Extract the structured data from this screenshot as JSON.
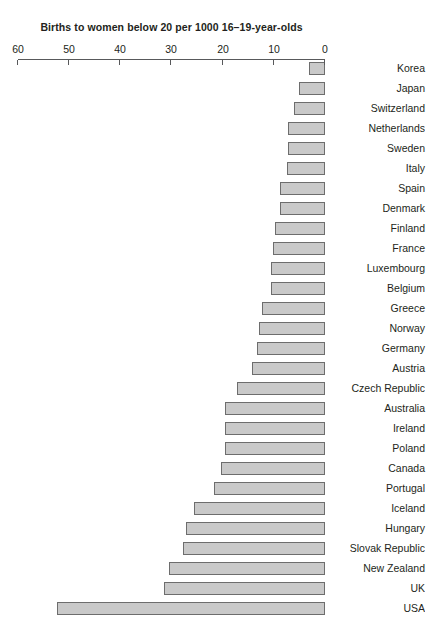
{
  "chart_data": {
    "type": "bar",
    "orientation": "horizontal",
    "title": "",
    "subtitle": "",
    "xlabel": "Births to women below 20 per 1000 16–19-year-olds",
    "ylabel": "",
    "xlim": [
      0,
      60
    ],
    "xticks": [
      0,
      10,
      20,
      30,
      40,
      50,
      60
    ],
    "xtick_labels": [
      "0",
      "10",
      "20",
      "30",
      "40",
      "50",
      "60"
    ],
    "grid": false,
    "legend": null,
    "bar_color": "#c9c9c9",
    "bar_edge_color": "#6d6d6d",
    "axis_color": "#58595b",
    "categories": [
      "USA",
      "UK",
      "New Zealand",
      "Slovak Republic",
      "Hungary",
      "Iceland",
      "Portugal",
      "Canada",
      "Poland",
      "Ireland",
      "Australia",
      "Czech Republic",
      "Austria",
      "Germany",
      "Norway",
      "Greece",
      "Belgium",
      "Luxembourg",
      "France",
      "Finland",
      "Denmark",
      "Spain",
      "Italy",
      "Sweden",
      "Netherlands",
      "Switzerland",
      "Japan",
      "Korea"
    ],
    "values": [
      52.3,
      31.4,
      30.5,
      27.7,
      27.1,
      25.6,
      21.7,
      20.3,
      19.5,
      19.5,
      19.5,
      17.2,
      14.3,
      13.3,
      12.9,
      12.3,
      10.5,
      10.5,
      10.2,
      9.8,
      8.8,
      8.8,
      7.4,
      7.2,
      7.2,
      6.1,
      5.1,
      3.1
    ],
    "annotations": []
  }
}
